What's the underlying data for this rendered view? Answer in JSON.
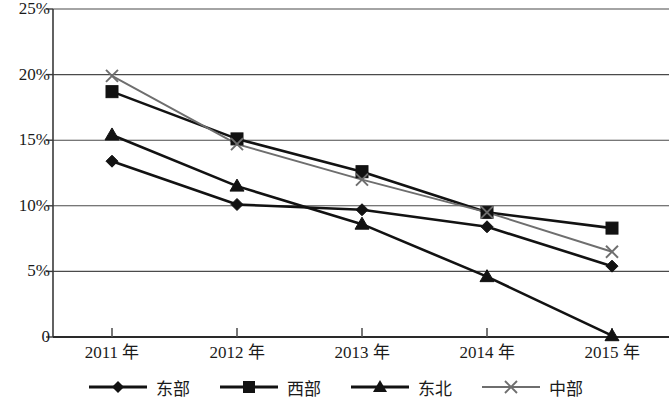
{
  "chart_data": {
    "type": "line",
    "title": "",
    "subtitle": "",
    "xlabel": "",
    "ylabel": "",
    "categories": [
      "2011 年",
      "2012 年",
      "2013 年",
      "2014 年",
      "2015 年"
    ],
    "ylim": [
      0,
      25
    ],
    "ytick_labels": [
      "0",
      "5%",
      "10%",
      "15%",
      "20%",
      "25%"
    ],
    "ytick_values": [
      0,
      5,
      10,
      15,
      20,
      25
    ],
    "grid": true,
    "legend_position": "bottom",
    "series": [
      {
        "name": "东部",
        "marker": "diamond",
        "color": "#121212",
        "values": [
          13.4,
          10.1,
          9.7,
          8.4,
          5.4
        ]
      },
      {
        "name": "西部",
        "marker": "square",
        "color": "#121212",
        "values": [
          18.7,
          15.1,
          12.6,
          9.5,
          8.3
        ]
      },
      {
        "name": "东北",
        "marker": "triangle",
        "color": "#121212",
        "values": [
          15.4,
          11.5,
          8.6,
          4.6,
          0.1
        ]
      },
      {
        "name": "中部",
        "marker": "x",
        "color": "#6e6e6e",
        "values": [
          19.9,
          14.7,
          12.0,
          9.5,
          6.5
        ]
      }
    ]
  },
  "axis": {
    "ylabels": [
      "25%",
      "20%",
      "15%",
      "10%",
      "5%",
      "0"
    ],
    "xlabels": [
      "2011 年",
      "2012 年",
      "2013 年",
      "2014 年",
      "2015 年"
    ]
  },
  "legend": {
    "items": [
      {
        "label": "东部",
        "marker": "diamond-marker",
        "color": "#121212"
      },
      {
        "label": "西部",
        "marker": "square-marker",
        "color": "#121212"
      },
      {
        "label": "东北",
        "marker": "triangle-marker",
        "color": "#121212"
      },
      {
        "label": "中部",
        "marker": "x-marker",
        "color": "#6e6e6e"
      }
    ]
  }
}
